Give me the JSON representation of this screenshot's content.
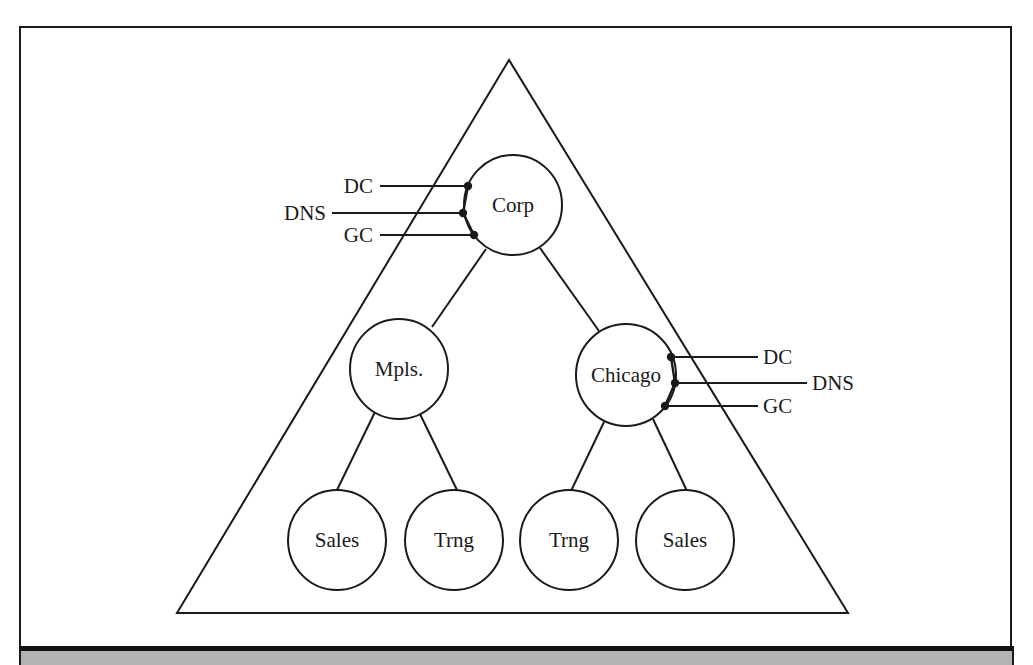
{
  "diagram": {
    "type": "active-directory-domain-tree",
    "colors": {
      "stroke": "#1a1a1a",
      "background": "#ffffff",
      "caption_band": "#b3b3b3",
      "caption_rule": "#111111"
    },
    "container": {
      "shape": "triangle",
      "points": [
        [
          509,
          60
        ],
        [
          177,
          613
        ],
        [
          848,
          613
        ]
      ]
    },
    "nodes": [
      {
        "id": "corp",
        "label": "Corp",
        "cx": 513,
        "cy": 205,
        "r": 49
      },
      {
        "id": "mpls",
        "label": "Mpls.",
        "cx": 399,
        "cy": 369,
        "r": 49
      },
      {
        "id": "chicago",
        "label": "Chicago",
        "cx": 626,
        "cy": 375,
        "r": 50
      },
      {
        "id": "mpls-sales",
        "label": "Sales",
        "cx": 337,
        "cy": 540,
        "r": 49
      },
      {
        "id": "mpls-trng",
        "label": "Trng",
        "cx": 454,
        "cy": 540,
        "r": 49
      },
      {
        "id": "chicago-trng",
        "label": "Trng",
        "cx": 569,
        "cy": 540,
        "r": 49
      },
      {
        "id": "chicago-sales",
        "label": "Sales",
        "cx": 685,
        "cy": 540,
        "r": 49
      }
    ],
    "edges": [
      {
        "from": "corp",
        "to": "mpls",
        "x1": 486,
        "y1": 249,
        "x2": 432,
        "y2": 327
      },
      {
        "from": "corp",
        "to": "chicago",
        "x1": 540,
        "y1": 248,
        "x2": 599,
        "y2": 331
      },
      {
        "from": "mpls",
        "to": "mpls-sales",
        "x1": 375,
        "y1": 412,
        "x2": 337,
        "y2": 490
      },
      {
        "from": "mpls",
        "to": "mpls-trng",
        "x1": 419,
        "y1": 412,
        "x2": 457,
        "y2": 490
      },
      {
        "from": "chicago",
        "to": "chicago-trng",
        "x1": 604,
        "y1": 422,
        "x2": 571,
        "y2": 491
      },
      {
        "from": "chicago",
        "to": "chicago-sales",
        "x1": 653,
        "y1": 419,
        "x2": 687,
        "y2": 491
      }
    ],
    "roles": [
      {
        "node": "corp",
        "label": "DC",
        "side": "left",
        "y": 186,
        "dot_x": 468,
        "line_end_x": 380,
        "text_x": 373
      },
      {
        "node": "corp",
        "label": "DNS",
        "side": "left",
        "y": 213,
        "dot_x": 463,
        "line_end_x": 332,
        "text_x": 326
      },
      {
        "node": "corp",
        "label": "GC",
        "side": "left",
        "y": 235,
        "dot_x": 474,
        "line_end_x": 380,
        "text_x": 373
      },
      {
        "node": "chicago",
        "label": "DC",
        "side": "right",
        "y": 357,
        "dot_x": 671,
        "line_end_x": 758,
        "text_x": 763
      },
      {
        "node": "chicago",
        "label": "DNS",
        "side": "right",
        "y": 383,
        "dot_x": 675,
        "line_end_x": 807,
        "text_x": 812
      },
      {
        "node": "chicago",
        "label": "GC",
        "side": "right",
        "y": 406,
        "dot_x": 665,
        "line_end_x": 758,
        "text_x": 763
      }
    ]
  }
}
